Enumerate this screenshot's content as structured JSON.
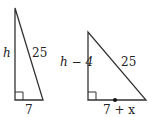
{
  "left_triangle": {
    "height_label": "h",
    "hypotenuse_label": "25",
    "base_label": "7"
  },
  "right_triangle": {
    "height_label": "h − 4",
    "hypotenuse_label": "25",
    "base_label": "7 + x"
  },
  "colors": {
    "line": "#333333",
    "background": "#ffffff"
  }
}
